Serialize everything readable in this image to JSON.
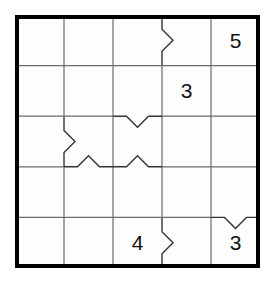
{
  "puzzle": {
    "type": "grid-logic-puzzle",
    "rows": 5,
    "cols": 5,
    "grid_geometry": {
      "origin_x": 15,
      "origin_y": 15,
      "width": 245,
      "height": 253,
      "cell_width": 49,
      "cell_height": 50.6
    },
    "colors": {
      "background": "#ffffff",
      "cell_fill": "#fdfdfd",
      "outer_border": "#000000",
      "inner_line": "#6b6b6b",
      "notch_line": "#333333",
      "digit": "#111111"
    },
    "line_widths": {
      "outer_border": 4,
      "inner_line": 1.2,
      "notch_line": 1.4
    },
    "cells": [
      [
        {
          "row": 1,
          "col": 1,
          "value": ""
        },
        {
          "row": 1,
          "col": 2,
          "value": ""
        },
        {
          "row": 1,
          "col": 3,
          "value": ""
        },
        {
          "row": 1,
          "col": 4,
          "value": ""
        },
        {
          "row": 1,
          "col": 5,
          "value": "5"
        }
      ],
      [
        {
          "row": 2,
          "col": 1,
          "value": ""
        },
        {
          "row": 2,
          "col": 2,
          "value": ""
        },
        {
          "row": 2,
          "col": 3,
          "value": ""
        },
        {
          "row": 2,
          "col": 4,
          "value": "3"
        },
        {
          "row": 2,
          "col": 5,
          "value": ""
        }
      ],
      [
        {
          "row": 3,
          "col": 1,
          "value": ""
        },
        {
          "row": 3,
          "col": 2,
          "value": ""
        },
        {
          "row": 3,
          "col": 3,
          "value": ""
        },
        {
          "row": 3,
          "col": 4,
          "value": ""
        },
        {
          "row": 3,
          "col": 5,
          "value": ""
        }
      ],
      [
        {
          "row": 4,
          "col": 1,
          "value": ""
        },
        {
          "row": 4,
          "col": 2,
          "value": ""
        },
        {
          "row": 4,
          "col": 3,
          "value": ""
        },
        {
          "row": 4,
          "col": 4,
          "value": ""
        },
        {
          "row": 4,
          "col": 5,
          "value": ""
        }
      ],
      [
        {
          "row": 5,
          "col": 1,
          "value": ""
        },
        {
          "row": 5,
          "col": 2,
          "value": ""
        },
        {
          "row": 5,
          "col": 3,
          "value": "4"
        },
        {
          "row": 5,
          "col": 4,
          "value": ""
        },
        {
          "row": 5,
          "col": 5,
          "value": "3"
        }
      ]
    ],
    "givens": [
      {
        "name": "given-r1c5",
        "row": 1,
        "col": 5,
        "value": "5"
      },
      {
        "name": "given-r2c4",
        "row": 2,
        "col": 4,
        "value": "3"
      },
      {
        "name": "given-r5c3",
        "row": 5,
        "col": 3,
        "value": "4"
      },
      {
        "name": "given-r5c5",
        "row": 5,
        "col": 5,
        "value": "3"
      }
    ],
    "notches": [
      {
        "name": "notch-vertical-r1-c3c4",
        "orientation": "vertical",
        "direction": "right",
        "row": 1,
        "between_cols": [
          3,
          4
        ]
      },
      {
        "name": "notch-horizontal-r2r3-c3",
        "orientation": "horizontal",
        "direction": "down",
        "col": 3,
        "between_rows": [
          2,
          3
        ]
      },
      {
        "name": "notch-vertical-r3-c1c2",
        "orientation": "vertical",
        "direction": "right",
        "row": 3,
        "between_cols": [
          1,
          2
        ]
      },
      {
        "name": "notch-horizontal-r3r4-c2",
        "orientation": "horizontal",
        "direction": "up",
        "col": 2,
        "between_rows": [
          3,
          4
        ]
      },
      {
        "name": "notch-horizontal-r3r4-c3",
        "orientation": "horizontal",
        "direction": "up",
        "col": 3,
        "between_rows": [
          3,
          4
        ]
      },
      {
        "name": "notch-horizontal-r4r5-c5",
        "orientation": "horizontal",
        "direction": "down",
        "col": 5,
        "between_rows": [
          4,
          5
        ]
      },
      {
        "name": "notch-vertical-r5-c3c4",
        "orientation": "vertical",
        "direction": "right",
        "row": 5,
        "between_cols": [
          3,
          4
        ]
      }
    ]
  }
}
